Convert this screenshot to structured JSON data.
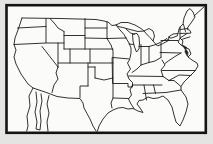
{
  "figure": {
    "type": "outline-map",
    "region": "Contiguous United States",
    "highlighted_state": "Missouri",
    "visible_text": "",
    "features": {
      "great_lakes_drawn": true,
      "baja_california_partial": true,
      "frame_cuts_map_bottom": true
    }
  },
  "colors": {
    "page_background": "#e4e4e2",
    "map_background": "#fbfbfa",
    "line": "#1c1c1c",
    "frame_stroke": "#141414",
    "highlight_fill": "#121212",
    "bay_fill": "#2a2a2a"
  }
}
